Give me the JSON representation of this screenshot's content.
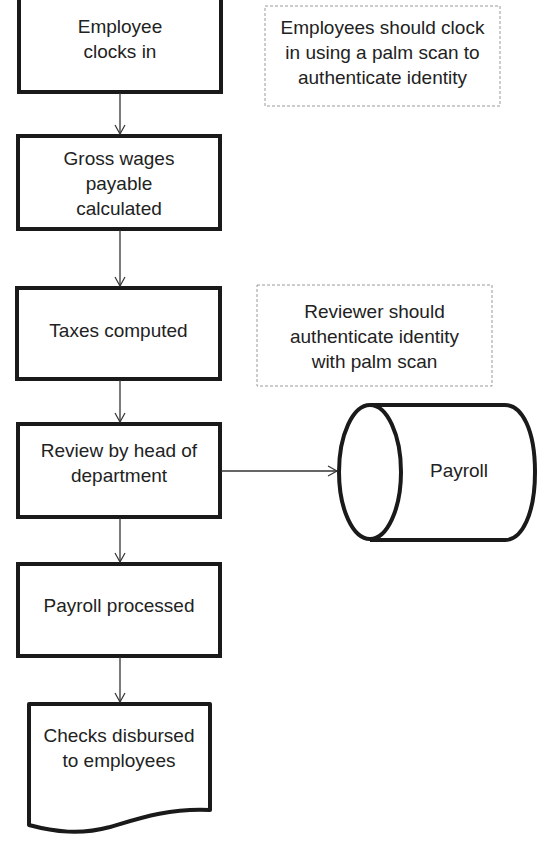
{
  "diagram": {
    "type": "flowchart",
    "colors": {
      "stroke": "#1a1a1a",
      "note_border": "#9a9a9a",
      "text": "#222222",
      "background": "#ffffff"
    },
    "nodes": [
      {
        "id": "clock_in",
        "shape": "process",
        "label": "Employee clocks in"
      },
      {
        "id": "gross_wages",
        "shape": "process",
        "label": "Gross wages payable calculated"
      },
      {
        "id": "taxes",
        "shape": "process",
        "label": "Taxes computed"
      },
      {
        "id": "review",
        "shape": "process",
        "label": "Review by head of department"
      },
      {
        "id": "processed",
        "shape": "process",
        "label": "Payroll processed"
      },
      {
        "id": "checks",
        "shape": "document",
        "label": "Checks disbursed to employees"
      },
      {
        "id": "payroll_db",
        "shape": "cylinder",
        "label": "Payroll"
      }
    ],
    "notes": [
      {
        "id": "note_clock",
        "label": "Employees should clock in using a palm scan to authenticate identity"
      },
      {
        "id": "note_review",
        "label": "Reviewer should authenticate identity with palm scan"
      }
    ],
    "edges": [
      {
        "from": "clock_in",
        "to": "gross_wages"
      },
      {
        "from": "gross_wages",
        "to": "taxes"
      },
      {
        "from": "taxes",
        "to": "review"
      },
      {
        "from": "review",
        "to": "processed"
      },
      {
        "from": "processed",
        "to": "checks"
      },
      {
        "from": "review",
        "to": "payroll_db"
      }
    ]
  },
  "text": {
    "clock_in_1": "Employee",
    "clock_in_2": "clocks in",
    "gross_1": "Gross wages",
    "gross_2": "payable",
    "gross_3": "calculated",
    "taxes": "Taxes computed",
    "review_1": "Review by head of",
    "review_2": "department",
    "processed": "Payroll processed",
    "checks_1": "Checks disbursed",
    "checks_2": "to employees",
    "payroll_db": "Payroll",
    "note1_1": "Employees should clock",
    "note1_2": "in using a palm scan to",
    "note1_3": "authenticate identity",
    "note2_1": "Reviewer should",
    "note2_2": "authenticate identity",
    "note2_3": "with palm scan"
  }
}
